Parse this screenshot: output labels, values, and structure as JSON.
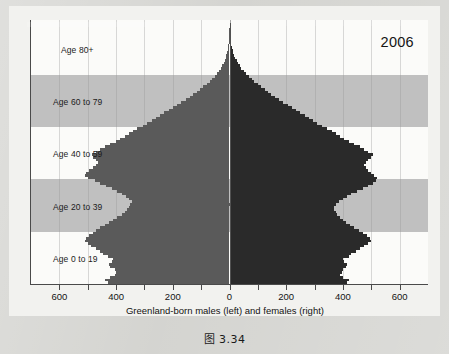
{
  "figure": {
    "caption": "图 3.34",
    "year_label": "2006"
  },
  "chart_data": {
    "type": "bar",
    "orientation": "horizontal",
    "subtype": "population-pyramid",
    "title": "",
    "xlabel": "Greenland-born males (left) and females (right)",
    "ylabel": "",
    "xlim": [
      -700,
      700
    ],
    "xticks": [
      -600,
      -400,
      -200,
      0,
      200,
      400,
      600
    ],
    "xticklabels": [
      "600",
      "400",
      "200",
      "0",
      "200",
      "400",
      "600"
    ],
    "grid": true,
    "grid_axis": "x",
    "legend": "none",
    "band_labels": [
      {
        "label": "Age 80+",
        "age_min": 80,
        "age_max": 100,
        "shaded": false
      },
      {
        "label": "Age 60 to 79",
        "age_min": 60,
        "age_max": 79,
        "shaded": true
      },
      {
        "label": "Age 40 to 59",
        "age_min": 40,
        "age_max": 59,
        "shaded": false
      },
      {
        "label": "Age 20 to 39",
        "age_min": 20,
        "age_max": 39,
        "shaded": true
      },
      {
        "label": "Age 0 to 19",
        "age_min": 0,
        "age_max": 19,
        "shaded": false
      }
    ],
    "colors": {
      "males": "#5a5a5a",
      "females": "#2a2a2a",
      "band_shade": "#c0c0c0",
      "panel": "#fbfbf9"
    },
    "ages": [
      0,
      1,
      2,
      3,
      4,
      5,
      6,
      7,
      8,
      9,
      10,
      11,
      12,
      13,
      14,
      15,
      16,
      17,
      18,
      19,
      20,
      21,
      22,
      23,
      24,
      25,
      26,
      27,
      28,
      29,
      30,
      31,
      32,
      33,
      34,
      35,
      36,
      37,
      38,
      39,
      40,
      41,
      42,
      43,
      44,
      45,
      46,
      47,
      48,
      49,
      50,
      51,
      52,
      53,
      54,
      55,
      56,
      57,
      58,
      59,
      60,
      61,
      62,
      63,
      64,
      65,
      66,
      67,
      68,
      69,
      70,
      71,
      72,
      73,
      74,
      75,
      76,
      77,
      78,
      79,
      80,
      81,
      82,
      83,
      84,
      85,
      86,
      87,
      88,
      89,
      90,
      91,
      92,
      93,
      94,
      95,
      96,
      97,
      98,
      99,
      100
    ],
    "series": [
      {
        "name": "Greenland-born males (left)",
        "side": "left",
        "values": [
          430,
          440,
          420,
          405,
          400,
          405,
          420,
          425,
          415,
          410,
          430,
          445,
          455,
          470,
          490,
          500,
          510,
          505,
          495,
          480,
          470,
          455,
          440,
          425,
          410,
          395,
          380,
          370,
          360,
          355,
          350,
          345,
          355,
          365,
          380,
          395,
          415,
          435,
          455,
          475,
          500,
          510,
          505,
          495,
          480,
          470,
          465,
          470,
          480,
          485,
          470,
          455,
          440,
          420,
          400,
          385,
          370,
          355,
          340,
          325,
          305,
          290,
          275,
          260,
          245,
          230,
          215,
          200,
          185,
          170,
          155,
          140,
          128,
          116,
          104,
          92,
          80,
          70,
          60,
          52,
          44,
          37,
          31,
          26,
          21,
          17,
          14,
          11,
          9,
          7,
          5,
          4,
          3,
          2,
          2,
          1,
          1,
          1,
          0,
          0,
          0
        ]
      },
      {
        "name": "Greenland-born females (right)",
        "side": "right",
        "values": [
          415,
          420,
          400,
          390,
          395,
          400,
          410,
          415,
          405,
          400,
          420,
          430,
          445,
          460,
          475,
          490,
          500,
          495,
          485,
          470,
          455,
          440,
          425,
          410,
          400,
          390,
          380,
          375,
          370,
          370,
          375,
          385,
          400,
          415,
          430,
          450,
          470,
          490,
          505,
          515,
          520,
          510,
          500,
          490,
          480,
          475,
          480,
          490,
          500,
          505,
          490,
          475,
          460,
          440,
          420,
          405,
          390,
          375,
          360,
          345,
          325,
          310,
          295,
          280,
          265,
          250,
          235,
          220,
          205,
          190,
          175,
          160,
          148,
          136,
          124,
          112,
          100,
          88,
          78,
          68,
          58,
          50,
          42,
          36,
          30,
          25,
          21,
          17,
          14,
          11,
          9,
          7,
          5,
          4,
          3,
          2,
          2,
          1,
          1,
          1,
          0
        ]
      }
    ]
  }
}
